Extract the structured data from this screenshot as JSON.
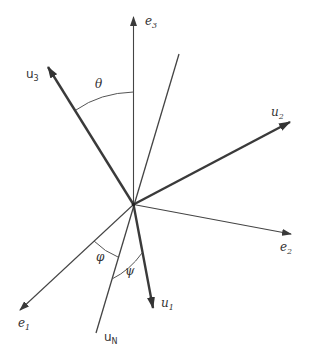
{
  "diagram": {
    "title": "",
    "origin": {
      "x": 133.5,
      "y": 204.5
    },
    "axes": [
      {
        "id": "e1",
        "label": "e",
        "sub": "1",
        "tip": {
          "x": 20,
          "y": 310
        },
        "style": "thin",
        "label_pos": {
          "x": 18,
          "y": 327
        }
      },
      {
        "id": "e2",
        "label": "e",
        "sub": "2",
        "tip": {
          "x": 291,
          "y": 234
        },
        "style": "thin",
        "label_pos": {
          "x": 280,
          "y": 251
        }
      },
      {
        "id": "e3",
        "label": "e",
        "sub": "3",
        "tip": {
          "x": 133.5,
          "y": 17
        },
        "style": "thin",
        "label_pos": {
          "x": 145,
          "y": 25
        }
      }
    ],
    "body_axes": [
      {
        "id": "u1",
        "label": "u",
        "sub": "1",
        "tip": {
          "x": 153,
          "y": 308
        },
        "style": "thick",
        "label_pos": {
          "x": 161,
          "y": 307
        }
      },
      {
        "id": "u2",
        "label": "u",
        "sub": "2",
        "tip": {
          "x": 290,
          "y": 122
        },
        "style": "thick",
        "label_pos": {
          "x": 271,
          "y": 116
        }
      },
      {
        "id": "u3",
        "label": "u",
        "sub": "3",
        "tip": {
          "x": 48,
          "y": 67
        },
        "style": "thick",
        "label_pos": {
          "x": 26,
          "y": 78
        }
      }
    ],
    "node_line": {
      "id": "uN",
      "label": "u",
      "sub": "N",
      "top": {
        "x": 179,
        "y": 54
      },
      "bottom": {
        "x": 96,
        "y": 333
      },
      "label_pos": {
        "x": 104,
        "y": 341
      }
    },
    "angles": [
      {
        "id": "theta",
        "label": "θ",
        "label_pos": {
          "x": 95,
          "y": 88
        },
        "between": [
          "e3",
          "u3"
        ]
      },
      {
        "id": "phi",
        "label": "φ",
        "label_pos": {
          "x": 96,
          "y": 261
        },
        "between": [
          "e1",
          "uN"
        ]
      },
      {
        "id": "psi",
        "label": "ψ",
        "label_pos": {
          "x": 125,
          "y": 275
        },
        "between": [
          "uN",
          "u1"
        ]
      }
    ]
  }
}
